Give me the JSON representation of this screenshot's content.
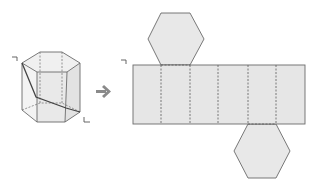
{
  "diagram": {
    "colors": {
      "face_fill": "#e6e6e6",
      "face_fill_light": "#eeeeee",
      "edge": "#6a6a6a",
      "hidden_edge": "#7a7a7a",
      "path": "#444444",
      "arrow": "#8a8a8a"
    },
    "prism": {
      "label_start": "ㄱ",
      "label_end": "ㄴ",
      "shape": "hexagonal-prism"
    },
    "arrow": {
      "direction": "right"
    },
    "net": {
      "label_start": "ㄱ",
      "lateral_faces": 6,
      "top_hexagon_attached_to_face": 2,
      "bottom_hexagon_attached_to_face": 5
    }
  }
}
